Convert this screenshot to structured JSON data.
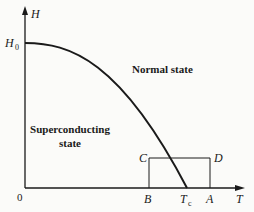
{
  "diagram": {
    "type": "phase-diagram",
    "axes": {
      "y_label": "H",
      "x_label": "T",
      "origin_label": "0"
    },
    "markers": {
      "h0_label": "H",
      "h0_sub": "0",
      "tc_label": "T",
      "tc_sub": "c"
    },
    "regions": {
      "normal": "Normal state",
      "superconducting_line1": "Superconducting",
      "superconducting_line2": "state"
    },
    "points": {
      "A": "A",
      "B": "B",
      "C": "C",
      "D": "D"
    },
    "colors": {
      "line": "#1a1a1a",
      "background": "#fbfbf9"
    }
  }
}
